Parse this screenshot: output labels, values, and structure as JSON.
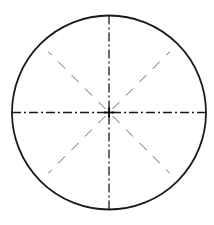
{
  "diagram": {
    "type": "circle-with-centerlines",
    "width": 214,
    "height": 225,
    "background": "#ffffff",
    "circle": {
      "cx": 109,
      "cy": 112.5,
      "r": 97,
      "stroke": "#1a1a1a",
      "stroke_width": 1.8
    },
    "centerlines": {
      "style": "dash-dot",
      "stroke": "#1a1a1a",
      "stroke_width": 1.3,
      "dasharray": "9 3 2 3",
      "lines": [
        {
          "name": "horizontal-centerline",
          "angle": 0
        },
        {
          "name": "vertical-centerline",
          "angle": 90
        }
      ]
    },
    "diagonals": {
      "style": "dashed",
      "stroke": "#555555",
      "stroke_width": 0.9,
      "dasharray": "10 9",
      "inner_r": 5,
      "outer_r": 86,
      "lines": [
        {
          "name": "diagonal-45",
          "angle": 45
        },
        {
          "name": "diagonal-135",
          "angle": 135
        },
        {
          "name": "diagonal-225",
          "angle": 225
        },
        {
          "name": "diagonal-315",
          "angle": 315
        }
      ]
    },
    "center_mark": {
      "size": 5,
      "stroke": "#000000",
      "stroke_width": 1.8
    }
  }
}
